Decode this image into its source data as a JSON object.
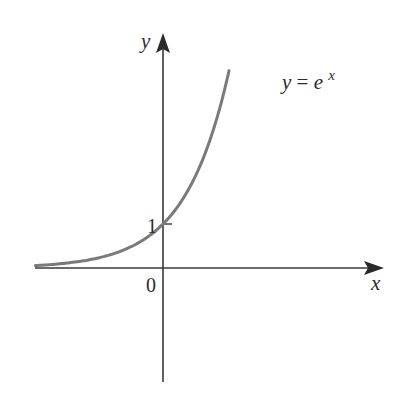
{
  "chart_data": {
    "type": "line",
    "title": "",
    "function": "y = e^x",
    "xlabel": "x",
    "ylabel": "y",
    "curve_label": "y = e^x",
    "annotations": [
      {
        "text": "1",
        "position": "y-intercept",
        "x": 0,
        "y": 1
      },
      {
        "text": "0",
        "position": "origin",
        "x": 0,
        "y": 0
      }
    ],
    "x": [
      -2.9,
      -2.5,
      -2.0,
      -1.5,
      -1.0,
      -0.5,
      0.0,
      0.5,
      1.0,
      1.5,
      1.5
    ],
    "y": [
      0.055,
      0.082,
      0.135,
      0.223,
      0.368,
      0.607,
      1.0,
      1.649,
      2.718,
      4.482,
      4.48
    ],
    "xlim": [
      -2.95,
      4.9
    ],
    "ylim": [
      -2.6,
      5.2
    ],
    "grid": false,
    "legend": "none",
    "curve_color": "#7a7a7a",
    "axis_color": "#3a3a3a"
  },
  "labels": {
    "y_axis": "y",
    "x_axis": "x",
    "origin": "0",
    "one": "1",
    "curve_lhs": "y = e",
    "curve_exp": "x"
  }
}
